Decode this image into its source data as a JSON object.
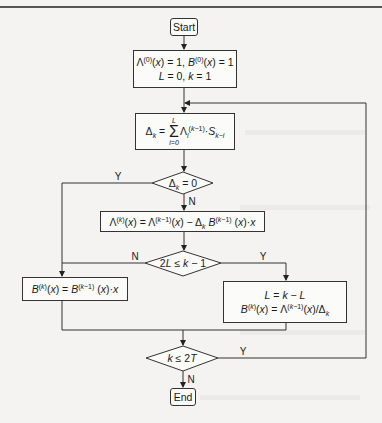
{
  "flowchart": {
    "start": {
      "label": "Start"
    },
    "init": {
      "line1": "Λ(0)(x) = 1, B(0)(x) = 1",
      "line2": "L = 0, k = 1"
    },
    "discrepancy": {
      "formula": "Δk = Σ(i=0..L) Λi(k−1)·Sk−i"
    },
    "decision_delta_zero": {
      "condition": "Δk = 0",
      "yes": "Y",
      "no": "N"
    },
    "update_lambda": {
      "formula": "Λ(k)(x) = Λ(k−1)(x) − Δk B(k−1)(x)·x"
    },
    "decision_2L": {
      "condition": "2L ≤ k − 1",
      "yes": "Y",
      "no": "N"
    },
    "shift_b": {
      "formula": "B(k)(x) = B(k−1)(x)·x"
    },
    "update_L_b": {
      "line1": "L = k − L",
      "line2": "B(k)(x) = Λ(k−1)(x)/Δk"
    },
    "decision_k": {
      "condition": "k ≤ 2T",
      "yes": "Y",
      "no": "N"
    },
    "end": {
      "label": "End"
    }
  },
  "colors": {
    "line": "#333333",
    "background": "#f4f3f1",
    "box_fill": "#fbfbfa"
  }
}
